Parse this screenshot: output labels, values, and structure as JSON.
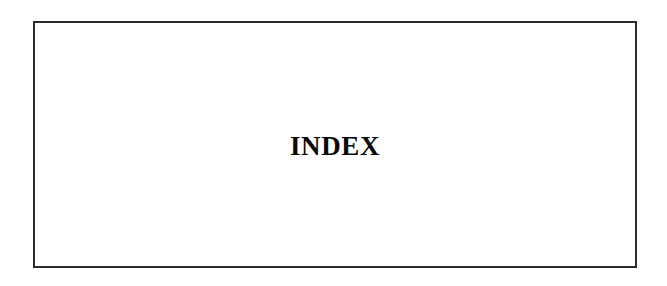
{
  "document": {
    "page_type": "section-divider",
    "background_color": "#ffffff"
  },
  "frame": {
    "border_color": "#2b2b2b",
    "fill_color": "#ffffff"
  },
  "heading": {
    "text": "INDEX",
    "color": "#0a0a0a"
  }
}
